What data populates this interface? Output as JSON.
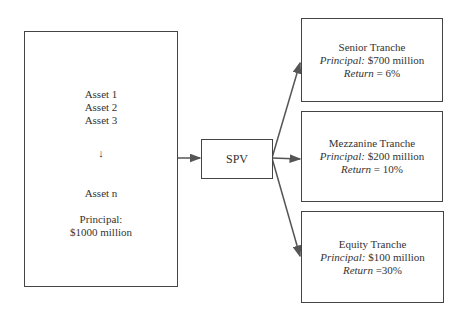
{
  "diagram": {
    "pool": {
      "assets": [
        "Asset 1",
        "Asset 2",
        "Asset 3"
      ],
      "ellipsis_arrow": "↓",
      "last_asset": "Asset n",
      "principal_label": "Principal:",
      "principal_value": "$1000 million"
    },
    "spv": {
      "label": "SPV"
    },
    "tranches": [
      {
        "name": "Senior Tranche",
        "principal_label": "Principal:",
        "principal_value": " $700 million",
        "return_label": "Return",
        "return_value": " = 6%"
      },
      {
        "name": "Mezzanine Tranche",
        "principal_label": "Principal:",
        "principal_value": " $200 million",
        "return_label": "Return",
        "return_value": " = 10%"
      },
      {
        "name": "Equity Tranche",
        "principal_label": "Principal:",
        "principal_value": " $100 million",
        "return_label": "Return",
        "return_value": " =30%"
      }
    ],
    "colors": {
      "stroke": "#444444",
      "arrow": "#555555",
      "text": "#333333"
    }
  }
}
